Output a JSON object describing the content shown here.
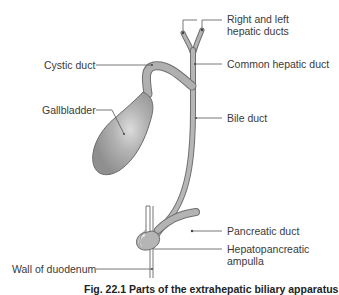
{
  "figure": {
    "caption": "Fig. 22.1 Parts of the extrahepatic biliary apparatus",
    "colors": {
      "duct_fill": "#a9a9a9",
      "duct_stroke": "#6f6f6f",
      "gallbladder_fill": "#a4a4a4",
      "gallbladder_highlight": "#d4d4d4",
      "leader_line": "#555555",
      "text": "#3a3a3a",
      "background": "#ffffff"
    }
  },
  "labels": {
    "right_left_hepatic": {
      "line1": "Right and left",
      "line2": "hepatic ducts"
    },
    "common_hepatic": "Common hepatic duct",
    "cystic_duct": "Cystic duct",
    "gallbladder": "Gallbladder",
    "bile_duct": "Bile duct",
    "pancreatic_duct": "Pancreatic duct",
    "hepatopancreatic_ampulla": {
      "line1": "Hepatopancreatic",
      "line2": "ampulla"
    },
    "wall_of_duodenum": "Wall of duodenum"
  }
}
